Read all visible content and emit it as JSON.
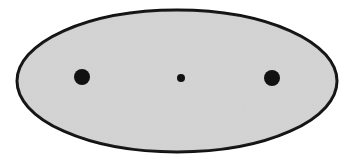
{
  "diagram": {
    "type": "ellipse-with-foci",
    "ellipse": {
      "cx": 177,
      "cy": 81,
      "rx": 160,
      "ry": 71,
      "fill": "#d4d4d4",
      "stroke": "#111111",
      "stroke_width": 3
    },
    "points": [
      {
        "name": "left-focus",
        "cx": 82,
        "cy": 77,
        "r": 8,
        "fill": "#111111"
      },
      {
        "name": "center",
        "cx": 181,
        "cy": 78,
        "r": 4,
        "fill": "#111111"
      },
      {
        "name": "right-focus",
        "cx": 272,
        "cy": 78,
        "r": 8,
        "fill": "#111111"
      }
    ]
  }
}
